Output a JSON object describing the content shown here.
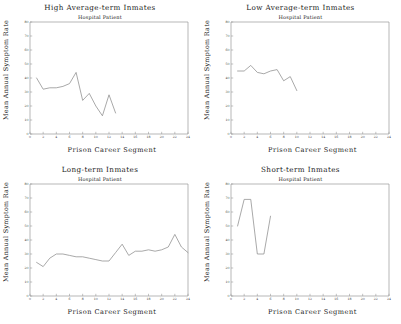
{
  "figure": {
    "panel_count": 4,
    "shared_xlabel": "Prison Career Segment",
    "shared_ylabel": "Mean Annual Symptom Rate",
    "shared_subtitle": "Hospital Patient",
    "line_color": "#8c8c8c",
    "axis_color": "#9a9a9a",
    "background": "#ffffff"
  },
  "panels": [
    {
      "title": "High Average-term Inmates",
      "subtitle": "Hospital Patient",
      "xlabel": "Prison Career Segment",
      "ylabel": "Mean Annual Symptom Rate"
    },
    {
      "title": "Low Average-term Inmates",
      "subtitle": "Hospital Patient",
      "xlabel": "Prison Career Segment",
      "ylabel": "Mean Annual Symptom Rate"
    },
    {
      "title": "Long-term Inmates",
      "subtitle": "Hospital Patient",
      "xlabel": "Prison Career Segment",
      "ylabel": "Mean Annual Symptom Rate"
    },
    {
      "title": "Short-term Inmates",
      "subtitle": "Hospital Patient",
      "xlabel": "Prison Career Segment",
      "ylabel": "Mean Annual Symptom Rate"
    }
  ],
  "chart_data": [
    {
      "type": "line",
      "title": "High Average-term Inmates",
      "subtitle": "Hospital Patient",
      "xlabel": "Prison Career Segment",
      "ylabel": "Mean Annual Symptom Rate",
      "xlim": [
        0,
        24
      ],
      "ylim": [
        0,
        80
      ],
      "xticks": [
        0,
        2,
        4,
        6,
        8,
        10,
        12,
        14,
        16,
        18,
        20,
        22,
        24
      ],
      "yticks": [
        0,
        10,
        20,
        30,
        40,
        50,
        60,
        70,
        80
      ],
      "grid": false,
      "legend": "none",
      "x": [
        1,
        2,
        3,
        4,
        5,
        6,
        7,
        8,
        9,
        10,
        11,
        12,
        13
      ],
      "values": [
        40,
        32,
        33,
        33,
        34,
        36,
        44,
        24,
        29,
        20,
        13,
        28,
        15
      ]
    },
    {
      "type": "line",
      "title": "Low Average-term Inmates",
      "subtitle": "Hospital Patient",
      "xlabel": "Prison Career Segment",
      "ylabel": "Mean Annual Symptom Rate",
      "xlim": [
        0,
        24
      ],
      "ylim": [
        0,
        80
      ],
      "xticks": [
        0,
        2,
        4,
        6,
        8,
        10,
        12,
        14,
        16,
        18,
        20,
        22,
        24
      ],
      "yticks": [
        0,
        10,
        20,
        30,
        40,
        50,
        60,
        70,
        80
      ],
      "grid": false,
      "legend": "none",
      "x": [
        1,
        2,
        3,
        4,
        5,
        6,
        7,
        8,
        9,
        10
      ],
      "values": [
        45,
        45,
        49,
        44,
        43,
        45,
        46,
        38,
        41,
        31
      ]
    },
    {
      "type": "line",
      "title": "Long-term Inmates",
      "subtitle": "Hospital Patient",
      "xlabel": "Prison Career Segment",
      "ylabel": "Mean Annual Symptom Rate",
      "xlim": [
        0,
        24
      ],
      "ylim": [
        0,
        80
      ],
      "xticks": [
        0,
        2,
        4,
        6,
        8,
        10,
        12,
        14,
        16,
        18,
        20,
        22,
        24
      ],
      "yticks": [
        0,
        10,
        20,
        30,
        40,
        50,
        60,
        70,
        80
      ],
      "grid": false,
      "legend": "none",
      "x": [
        1,
        2,
        3,
        4,
        5,
        6,
        7,
        8,
        9,
        10,
        11,
        12,
        13,
        14,
        15,
        16,
        17,
        18,
        19,
        20,
        21,
        22,
        23,
        24
      ],
      "values": [
        24,
        21,
        27,
        30,
        30,
        29,
        28,
        28,
        27,
        26,
        25,
        25,
        31,
        37,
        29,
        32,
        32,
        33,
        32,
        33,
        35,
        44,
        35,
        31
      ]
    },
    {
      "type": "line",
      "title": "Short-term Inmates",
      "subtitle": "Hospital Patient",
      "xlabel": "Prison Career Segment",
      "ylabel": "Mean Annual Symptom Rate",
      "xlim": [
        0,
        24
      ],
      "ylim": [
        0,
        80
      ],
      "xticks": [
        0,
        2,
        4,
        6,
        8,
        10,
        12,
        14,
        16,
        18,
        20,
        22,
        24
      ],
      "yticks": [
        0,
        10,
        20,
        30,
        40,
        50,
        60,
        70,
        80
      ],
      "grid": false,
      "legend": "none",
      "x": [
        1,
        2,
        3,
        4,
        5,
        6
      ],
      "values": [
        50,
        69,
        69,
        30,
        30,
        57
      ]
    }
  ]
}
